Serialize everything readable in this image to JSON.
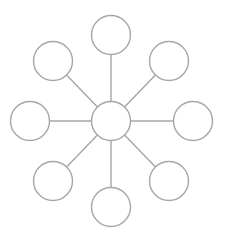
{
  "diagram": {
    "type": "hub-and-spoke",
    "stroke_color": "#a6a6a6",
    "fill_color": "#ffffff",
    "stroke_width": 1.4,
    "node_radius": 19.5,
    "hub": {
      "id": "hub",
      "cx": 111,
      "cy": 121
    },
    "spokes": [
      {
        "id": "top",
        "cx": 111,
        "cy": 35
      },
      {
        "id": "top-right",
        "cx": 169,
        "cy": 61
      },
      {
        "id": "right",
        "cx": 193,
        "cy": 121
      },
      {
        "id": "bottom-right",
        "cx": 169,
        "cy": 181
      },
      {
        "id": "bottom",
        "cx": 111,
        "cy": 207
      },
      {
        "id": "bottom-left",
        "cx": 53,
        "cy": 181
      },
      {
        "id": "left",
        "cx": 30,
        "cy": 121
      },
      {
        "id": "top-left",
        "cx": 53,
        "cy": 61
      }
    ]
  }
}
